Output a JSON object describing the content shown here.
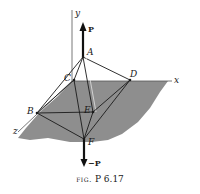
{
  "figure": {
    "caption_prefix": "fig.",
    "caption_number": "P 6.17",
    "colors": {
      "plane": "#8e8e8e",
      "lines": "#1a1a1a",
      "background": "#ffffff"
    }
  },
  "axes": {
    "x": "x",
    "y": "y",
    "z": "z"
  },
  "points": {
    "A": "A",
    "B": "B",
    "C": "C",
    "D": "D",
    "E": "E",
    "F": "F"
  },
  "forces": {
    "top": "P",
    "bottom": "−P"
  }
}
